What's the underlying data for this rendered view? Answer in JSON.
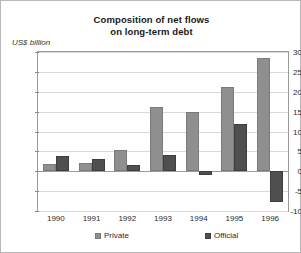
{
  "chart_data": {
    "type": "bar",
    "title": "Composition of net flows on long-term debt",
    "title_line1": "Composition of net flows",
    "title_line2": "on long-term debt",
    "ylabel": "US$ billion",
    "xlabel": "",
    "categories": [
      "1990",
      "1991",
      "1992",
      "1993",
      "1994",
      "1995",
      "1996"
    ],
    "series": [
      {
        "name": "Private",
        "color": "#8f8f8f",
        "values": [
          1.7,
          2.1,
          5.4,
          16.2,
          15.0,
          21.3,
          28.5
        ]
      },
      {
        "name": "Official",
        "color": "#4f4f4f",
        "values": [
          3.9,
          3.0,
          1.5,
          4.0,
          -0.9,
          11.9,
          -7.7
        ]
      }
    ],
    "ylim": [
      -10,
      30
    ],
    "ytick_step": 5,
    "yticks": [
      "30",
      "25",
      "20",
      "15",
      "10",
      "5",
      "0",
      "-5",
      "-10"
    ],
    "grid": true,
    "legend_position": "bottom"
  }
}
